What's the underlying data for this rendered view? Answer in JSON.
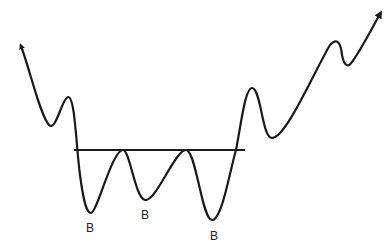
{
  "diagram": {
    "type": "triple-bottom-pattern",
    "stroke_color": "#1a1a1a",
    "background": "#ffffff",
    "neckline": {
      "x1": 74,
      "y1": 150,
      "x2": 245,
      "y2": 150
    },
    "bottom_labels": [
      {
        "text": "B",
        "x": 90,
        "y": 232
      },
      {
        "text": "B",
        "x": 146,
        "y": 219
      },
      {
        "text": "B",
        "x": 215,
        "y": 240
      }
    ],
    "arrows": {
      "start": "arrow-up-left",
      "end": "arrow-up-right"
    }
  }
}
